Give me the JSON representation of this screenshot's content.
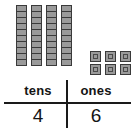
{
  "diagram": {
    "blocks": {
      "tens": {
        "rod_count": 4,
        "units_per_rod": 10,
        "block_fill_color": "#9a9a9a",
        "block_border_color": "#3a3a3a",
        "icon_name": "tens-rod-icon"
      },
      "ones": {
        "cube_count": 6,
        "columns": 3,
        "rows": 2,
        "block_fill_color": "#9a9a9a",
        "block_border_color": "#3a3a3a",
        "icon_name": "ones-cube-icon"
      }
    },
    "table": {
      "headers": [
        "tens",
        "ones"
      ],
      "values": [
        "4",
        "6"
      ],
      "rule_color": "#1a1a1a",
      "text_color": "#141414"
    }
  }
}
